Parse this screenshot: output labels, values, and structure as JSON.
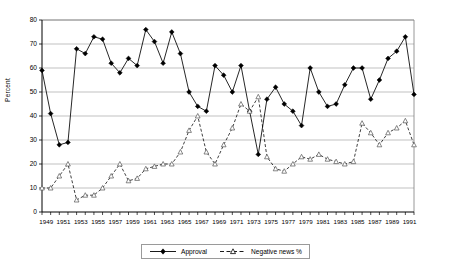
{
  "chart_data": {
    "type": "line",
    "title": "",
    "xlabel": "",
    "ylabel": "Percent",
    "ylim": [
      0,
      80
    ],
    "ytick_step": 10,
    "yticks": [
      0,
      10,
      20,
      30,
      40,
      50,
      60,
      70,
      80
    ],
    "xlim": [
      1949,
      1992
    ],
    "xticks": [
      1949,
      1951,
      1953,
      1955,
      1957,
      1959,
      1961,
      1963,
      1965,
      1967,
      1969,
      1971,
      1973,
      1975,
      1977,
      1979,
      1981,
      1983,
      1985,
      1987,
      1989,
      1991
    ],
    "xtick_labels": [
      "1949",
      "1951",
      "1953",
      "1955",
      "1957",
      "1959",
      "1961",
      "1963",
      "1965",
      "1967",
      "1969",
      "1971",
      "1973",
      "1975",
      "1977",
      "1979",
      "1981",
      "1983",
      "1985",
      "1987",
      "1989",
      "1991"
    ],
    "grid": "horizontal",
    "legend_position": "bottom-center",
    "x": [
      1949,
      1950,
      1951,
      1952,
      1953,
      1954,
      1955,
      1956,
      1957,
      1958,
      1959,
      1960,
      1961,
      1962,
      1963,
      1964,
      1965,
      1966,
      1967,
      1968,
      1969,
      1970,
      1971,
      1972,
      1973,
      1974,
      1975,
      1976,
      1977,
      1978,
      1979,
      1980,
      1981,
      1982,
      1983,
      1984,
      1985,
      1986,
      1987,
      1988,
      1989,
      1990,
      1991,
      1992
    ],
    "series": [
      {
        "name": "Approval",
        "style": "solid",
        "marker": "filled-diamond",
        "color": "#000000",
        "values": [
          59,
          41,
          28,
          29,
          68,
          66,
          73,
          72,
          62,
          58,
          64,
          61,
          76,
          71,
          62,
          75,
          66,
          50,
          44,
          42,
          61,
          57,
          50,
          61,
          42,
          24,
          47,
          52,
          45,
          42,
          36,
          60,
          50,
          44,
          45,
          53,
          60,
          60,
          47,
          55,
          64,
          67,
          73,
          49
        ]
      },
      {
        "name": "Negative news %",
        "style": "dashed",
        "marker": "open-triangle",
        "color": "#000000",
        "values": [
          10,
          10,
          15,
          20,
          5,
          7,
          7,
          10,
          15,
          20,
          13,
          14,
          18,
          19,
          20,
          20,
          25,
          34,
          40,
          25,
          20,
          28,
          35,
          45,
          42,
          48,
          23,
          18,
          17,
          20,
          23,
          22,
          24,
          22,
          21,
          20,
          21,
          37,
          33,
          28,
          33,
          35,
          38,
          28
        ]
      }
    ]
  }
}
